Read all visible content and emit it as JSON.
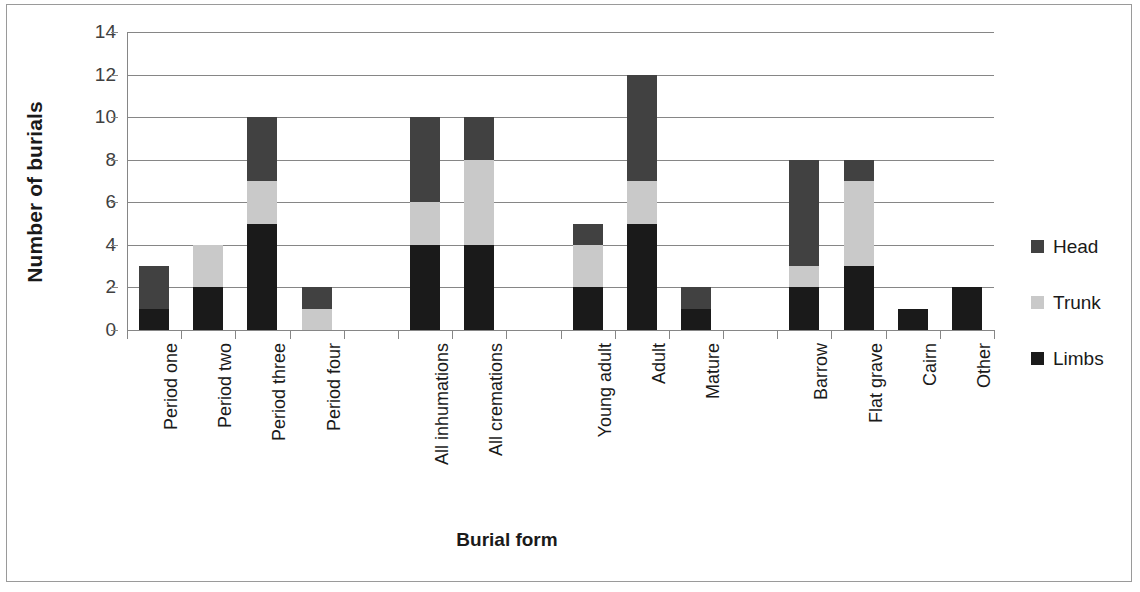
{
  "chart_data": {
    "type": "bar",
    "subtype": "stacked-bar",
    "title": "",
    "xlabel": "Burial form",
    "ylabel": "Number of burials",
    "ylim": [
      0,
      14
    ],
    "yticks": [
      0,
      2,
      4,
      6,
      8,
      10,
      12,
      14
    ],
    "grid": true,
    "legend_position": "right",
    "categories": [
      "Period one",
      "Period two",
      "Period three",
      "Period four",
      "",
      "All inhumations",
      "All cremations",
      "",
      "Young adult",
      "Adult",
      "Mature",
      "",
      "Barrow",
      "Flat grave",
      "Cairn",
      "Other"
    ],
    "series": [
      {
        "name": "Limbs",
        "color": "#1a1a1a",
        "values": [
          1,
          2,
          5,
          0,
          0,
          4,
          4,
          0,
          2,
          5,
          1,
          0,
          2,
          3,
          1,
          2
        ]
      },
      {
        "name": "Trunk",
        "color": "#c9c9c9",
        "values": [
          0,
          2,
          2,
          1,
          0,
          2,
          4,
          0,
          2,
          2,
          0,
          0,
          1,
          4,
          0,
          0
        ]
      },
      {
        "name": "Head",
        "color": "#414141",
        "values": [
          2,
          0,
          3,
          1,
          0,
          4,
          2,
          0,
          1,
          5,
          1,
          0,
          5,
          1,
          0,
          0
        ]
      }
    ],
    "totals": [
      3,
      4,
      10,
      2,
      0,
      10,
      10,
      0,
      5,
      12,
      2,
      0,
      8,
      8,
      1,
      2
    ],
    "legend": [
      {
        "label": "Head",
        "color": "#414141"
      },
      {
        "label": "Trunk",
        "color": "#c9c9c9"
      },
      {
        "label": "Limbs",
        "color": "#1a1a1a"
      }
    ],
    "stack_order_bottom_to_top": [
      "Limbs",
      "Trunk",
      "Head"
    ]
  }
}
